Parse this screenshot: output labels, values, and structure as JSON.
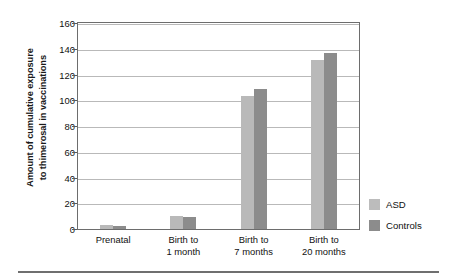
{
  "chart_data": {
    "type": "bar",
    "title": "",
    "xlabel": "",
    "ylabel": "Amount of cumulative exposure to thimerosal in vaccinations",
    "ylabel_lines": [
      "Amount of cumulative exposure",
      "to thimerosal in vaccinations"
    ],
    "categories": [
      "Prenatal",
      "Birth to 1 month",
      "Birth to 7 months",
      "Birth to 20 months"
    ],
    "category_lines": [
      [
        "Prenatal"
      ],
      [
        "Birth to",
        "1 month"
      ],
      [
        "Birth to",
        "7 months"
      ],
      [
        "Birth to",
        "20 months"
      ]
    ],
    "series": [
      {
        "name": "ASD",
        "color": "#b9b9b9",
        "values": [
          3,
          10,
          103,
          131
        ]
      },
      {
        "name": "Controls",
        "color": "#8c8c8c",
        "values": [
          2,
          9.5,
          109,
          137
        ]
      }
    ],
    "ylim": [
      0,
      160
    ],
    "yticks": [
      0,
      20,
      40,
      60,
      80,
      100,
      120,
      140,
      160
    ],
    "ytick_labels": [
      "0",
      "20",
      "40",
      "60",
      "80",
      "100",
      "120",
      "140",
      "160"
    ],
    "grid": true,
    "grid_axis": "y",
    "legend_position": "right"
  },
  "legend": {
    "items": [
      {
        "label": "ASD",
        "color": "#b9b9b9"
      },
      {
        "label": "Controls",
        "color": "#8c8c8c"
      }
    ]
  },
  "colors": {
    "asd": "#b9b9b9",
    "controls": "#8c8c8c",
    "axis": "#6d6d6d",
    "gridline": "#b9b9b9",
    "text": "#111111",
    "background": "#ffffff"
  }
}
